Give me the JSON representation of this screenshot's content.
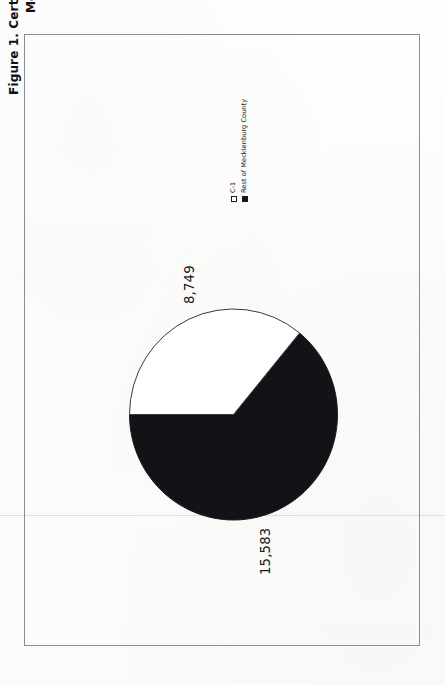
{
  "figure": {
    "title_line1": "Figure 1. Certificates of Occupancy Issued in Mecklenburg County,",
    "title_line2": "1998–2000",
    "title_full": "Figure 1. Certificates of Occupancy Issued in Mecklenburg County,\n1998–2000"
  },
  "legend": {
    "items": [
      {
        "label": "C-1",
        "swatch": "open-square-white",
        "color": "#ffffff"
      },
      {
        "label": "Rest of Mecklenburg County",
        "swatch": "filled-square-black",
        "color": "#131317"
      }
    ]
  },
  "labels": {
    "c1_value": "8,749",
    "rest_value": "15,583"
  },
  "chart_data": {
    "type": "pie",
    "title": "Figure 1. Certificates of Occupancy Issued in Mecklenburg County, 1998–2000",
    "categories": [
      "C-1",
      "Rest of Mecklenburg County"
    ],
    "values": [
      8749,
      15583
    ],
    "value_labels": [
      "8,749",
      "15,583"
    ],
    "percentages": [
      35.96,
      64.04
    ],
    "total": 24332,
    "colors": [
      "#ffffff",
      "#131317"
    ],
    "slice_edge_color": "#1a1a1e",
    "legend_position": "right",
    "grid": false,
    "rotation_deg": -90,
    "note": "Figure is printed sideways on the scanned page (rotated 90 degrees counter-clockwise)."
  },
  "colors": {
    "page_background": "#fdfdfc",
    "frame_border": "#8e8e92",
    "ink": "#16161a",
    "slice_c1": "#ffffff",
    "slice_rest": "#131317"
  }
}
